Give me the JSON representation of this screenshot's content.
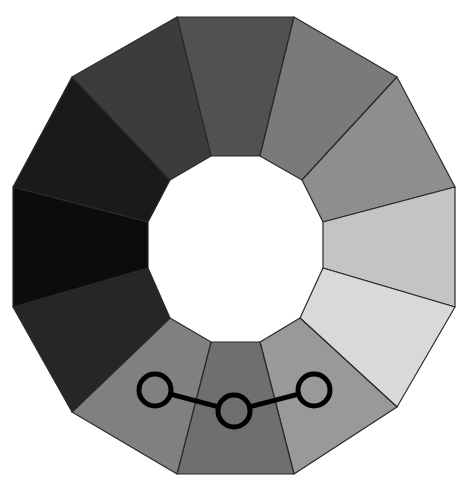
{
  "diagram": {
    "type": "dodecagonal-ring",
    "segments": [
      {
        "id": "top",
        "color": "#515151"
      },
      {
        "id": "top-right-1",
        "color": "#7a7a7a"
      },
      {
        "id": "top-right-2",
        "color": "#8e8e8e"
      },
      {
        "id": "right-upper",
        "color": "#c4c4c4"
      },
      {
        "id": "right-lower",
        "color": "#d9d9d9"
      },
      {
        "id": "bottom-right",
        "color": "#999999"
      },
      {
        "id": "bottom",
        "color": "#6f6f6f"
      },
      {
        "id": "bottom-left",
        "color": "#808080"
      },
      {
        "id": "left-lower",
        "color": "#262626"
      },
      {
        "id": "left-upper",
        "color": "#0c0c0c"
      },
      {
        "id": "top-left-2",
        "color": "#1a1a1a"
      },
      {
        "id": "top-left-1",
        "color": "#3c3c3c"
      }
    ],
    "connector": {
      "nodes": [
        {
          "id": "node-left",
          "cx": 155,
          "cy": 390,
          "r": 16
        },
        {
          "id": "node-center",
          "cx": 234,
          "cy": 411,
          "r": 16
        },
        {
          "id": "node-right",
          "cx": 314,
          "cy": 390,
          "r": 16
        }
      ],
      "stroke_color": "#000000"
    },
    "background": "#ffffff"
  }
}
